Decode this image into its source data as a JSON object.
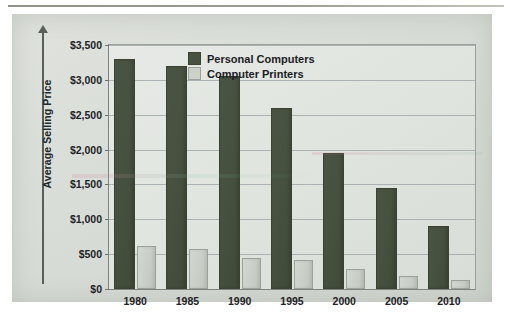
{
  "chart_data": {
    "type": "bar",
    "title": "",
    "subtitle": "",
    "xlabel": "",
    "ylabel": "Average Selling Price",
    "categories": [
      "1980",
      "1985",
      "1990",
      "1995",
      "2000",
      "2005",
      "2010"
    ],
    "series": [
      {
        "name": "Personal Computers",
        "color": "#46513f",
        "values": [
          3300,
          3200,
          3050,
          2600,
          1950,
          1450,
          900
        ]
      },
      {
        "name": "Computer Printers",
        "color": "#ccd1ca",
        "values": [
          620,
          570,
          450,
          420,
          290,
          190,
          130
        ]
      }
    ],
    "ylim": [
      0,
      3500
    ],
    "ytick_values": [
      0,
      500,
      1000,
      1500,
      2000,
      2500,
      3000,
      3500
    ],
    "ytick_labels": [
      "$0",
      "$500",
      "$1,000",
      "$1,500",
      "$2,000",
      "$2,500",
      "$3,000",
      "$3,500"
    ],
    "grid": true,
    "legend_position": "top-right"
  },
  "axes": {
    "y_title": "Average Selling Price",
    "y_arrow": "up-arrow-icon"
  },
  "legend": {
    "items": [
      {
        "label": "Personal Computers",
        "swatch": "legend-swatch-dark-green"
      },
      {
        "label": "Computer Printers",
        "swatch": "legend-swatch-light-gray"
      }
    ]
  },
  "colors": {
    "personal_computers": "#46513f",
    "computer_printers": "#ccd1ca",
    "panel_background": "#d9ddd8",
    "plot_background": "#e2e6e1",
    "gridline": "#9aa2a6",
    "axis": "#7d8480",
    "text": "#1e2326"
  }
}
